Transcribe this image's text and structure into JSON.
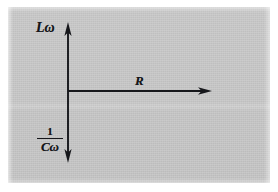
{
  "figure": {
    "kind": "vector-diagram",
    "background_color": "#c7c7c7",
    "ink_color": "#16171b",
    "page_color": "#ffffff"
  },
  "labels": {
    "vertical_up": "Lω",
    "horizontal_right": "R",
    "vertical_down_numerator": "1",
    "vertical_down_denominator": "Cω"
  },
  "axes": [
    {
      "name": "inductive-reactance-axis",
      "label": "Lω",
      "direction": "up",
      "arrowhead": true,
      "from": [
        68,
        91
      ],
      "to": [
        68,
        23
      ]
    },
    {
      "name": "resistance-axis",
      "label": "R",
      "direction": "right",
      "arrowhead": true,
      "from": [
        68,
        91
      ],
      "to": [
        211,
        91
      ]
    },
    {
      "name": "capacitive-reactance-axis",
      "label": "1/Cω",
      "direction": "down",
      "arrowhead": true,
      "from": [
        68,
        91
      ],
      "to": [
        68,
        162
      ]
    }
  ],
  "origin": {
    "x": 68,
    "y": 91
  }
}
